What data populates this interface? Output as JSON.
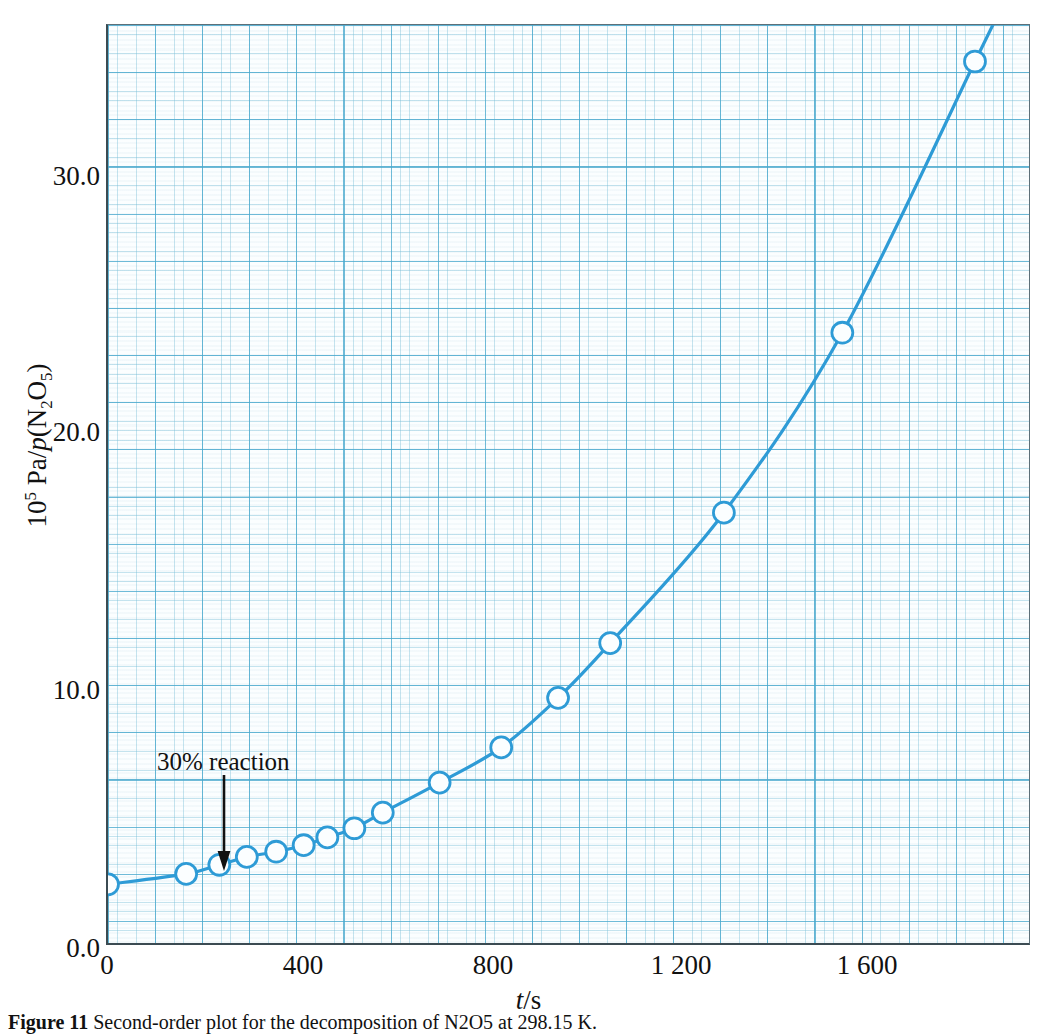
{
  "figure": {
    "background_color": "#ffffff",
    "curve_color": "#2e9bd6",
    "grid_major_color": "#48a8cd",
    "grid_minor_color": "#78bed7",
    "axis_color": "#3b4b52"
  },
  "axes": {
    "y_label_prefix": "10",
    "y_label_exponent": "5",
    "y_label_mid": " Pa/",
    "y_label_italic": "p",
    "y_label_open": "(N",
    "y_label_sub1": "2",
    "y_label_o": "O",
    "y_label_sub2": "5",
    "y_label_close": ")",
    "x_label_italic": "t",
    "x_label_rest": "/s",
    "y_ticks": [
      "0.0",
      "10.0",
      "20.0",
      "30.0"
    ],
    "x_ticks": [
      "0",
      "400",
      "800",
      "1 200",
      "1 600"
    ]
  },
  "annotations": {
    "reaction_label": "30% reaction"
  },
  "caption": {
    "label": "Figure 11",
    "text": "Second-order plot for the decomposition of N2O5 at 298.15 K."
  },
  "chart_data": {
    "type": "line",
    "title": "",
    "xlabel": "t/s",
    "ylabel": "10^5 Pa/p(N2O5)",
    "xlim": [
      0,
      1944
    ],
    "ylim": [
      0.0,
      35.2
    ],
    "grid": true,
    "legend": "none",
    "x_tick_values": [
      0,
      400,
      800,
      1200,
      1600
    ],
    "y_tick_values": [
      0.0,
      10.0,
      20.0,
      30.0
    ],
    "annotation_point": {
      "x": 247,
      "y": 3.1,
      "label": "30% reaction"
    },
    "series": [
      {
        "name": "1/p(N2O5)",
        "marker": "open-circle",
        "x": [
          0,
          165,
          235,
          293,
          355,
          413,
          463,
          520,
          580,
          700,
          830,
          950,
          1060,
          1300,
          1550,
          1830
        ],
        "y": [
          2.25,
          2.65,
          3.0,
          3.3,
          3.5,
          3.75,
          4.05,
          4.4,
          5.0,
          6.15,
          7.5,
          9.4,
          11.5,
          16.5,
          23.4,
          33.8
        ]
      }
    ]
  }
}
